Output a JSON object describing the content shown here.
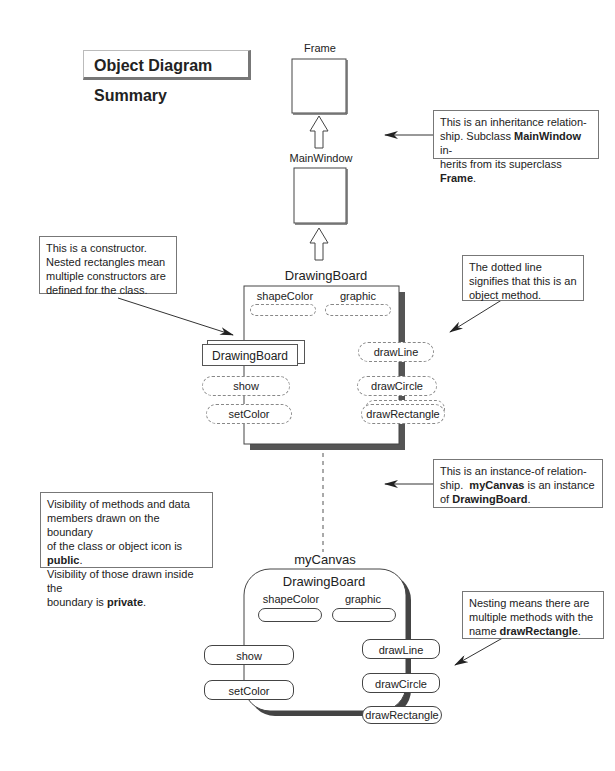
{
  "title": "Object Diagram Summary",
  "classes": {
    "frame": {
      "label": "Frame"
    },
    "main_window": {
      "label": "MainWindow"
    },
    "drawing_board": {
      "label": "DrawingBoard",
      "data_members": [
        "shapeColor",
        "graphic"
      ],
      "constructor": "DrawingBoard",
      "public_methods_left": [
        "show",
        "setColor"
      ],
      "methods_right": [
        "drawLine",
        "drawCircle",
        "drawRectangle"
      ]
    }
  },
  "object": {
    "name": "myCanvas",
    "class_label": "DrawingBoard",
    "data_members": [
      "shapeColor",
      "graphic"
    ],
    "methods_left": [
      "show",
      "setColor"
    ],
    "methods_right": [
      "drawLine",
      "drawCircle",
      "drawRectangle"
    ]
  },
  "callouts": {
    "inheritance": {
      "l1a": "This is an inheritance relation-",
      "l2a": "ship. Subclass ",
      "l2b": "MainWindow",
      "l2c": " in-",
      "l3a": "herits from its superclass ",
      "l3b": "Frame",
      "l3c": "."
    },
    "constructor": {
      "text": "This is a constructor. Nested rectangles mean multiple constructors are defined for the class."
    },
    "object_method": {
      "text": "The dotted line signifies that this is an object method."
    },
    "instance_of": {
      "l1a": "This is an instance-of relation-",
      "l2a": "ship.  ",
      "l2b": "myCanvas",
      "l2c": " is an instance",
      "l3a": "of ",
      "l3b": "DrawingBoard",
      "l3c": "."
    },
    "visibility": {
      "l1": "Visibility of methods and data",
      "l2": "members drawn on the boundary",
      "l3a": "of the class or object icon is ",
      "l3b": "public",
      "l3c": ".",
      "l4": "Visibility of those drawn inside the",
      "l5a": "boundary is ",
      "l5b": "private",
      "l5c": "."
    },
    "nesting": {
      "l1": "Nesting means there are",
      "l2": "multiple methods with the",
      "l3a": "name ",
      "l3b": "drawRectangle",
      "l3c": "."
    }
  },
  "colors": {
    "line": "#444444",
    "shadow": "#555555",
    "dotted": "#888888"
  }
}
